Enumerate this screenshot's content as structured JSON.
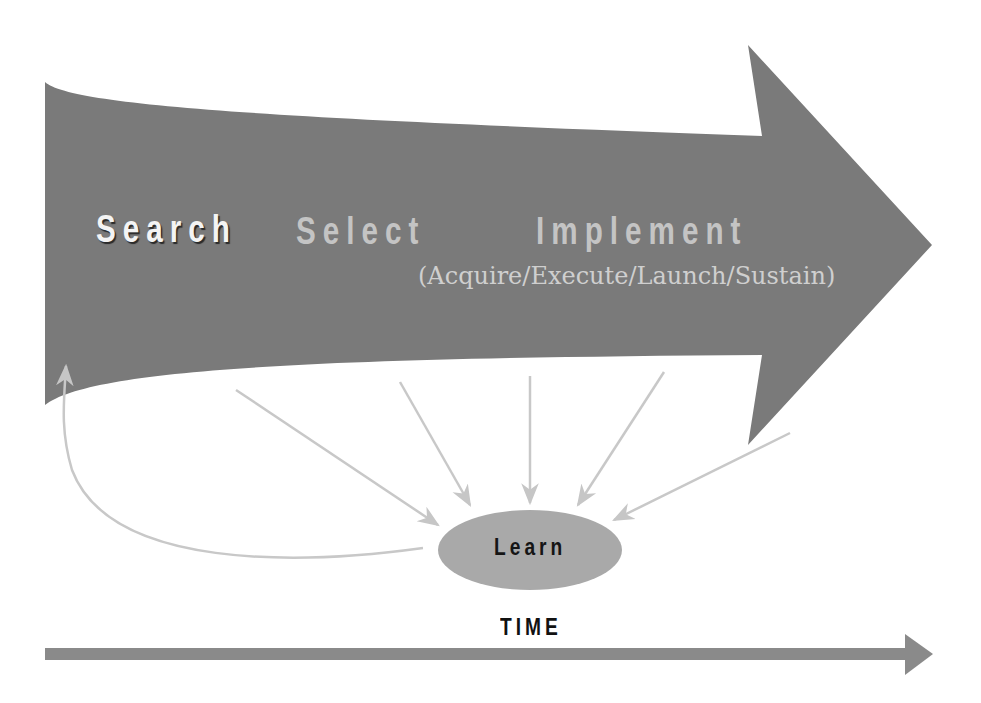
{
  "diagram": {
    "type": "process-flow",
    "main_arrow": {
      "stages": [
        {
          "label": "Search",
          "emphasis": "highlighted"
        },
        {
          "label": "Select",
          "emphasis": "muted"
        },
        {
          "label": "Implement",
          "emphasis": "muted",
          "sublabel": "(Acquire/Execute/Launch/Sustain)"
        }
      ],
      "fill_color": "#7a7a7a"
    },
    "learn_node": {
      "label": "Learn",
      "fill_color": "#a9a9a9",
      "incoming_arrows": 5,
      "feedback_arrow_to": "Search"
    },
    "time_axis": {
      "label": "TIME",
      "color": "#8a8a8a"
    },
    "connector_color": "#c8c8c8"
  }
}
